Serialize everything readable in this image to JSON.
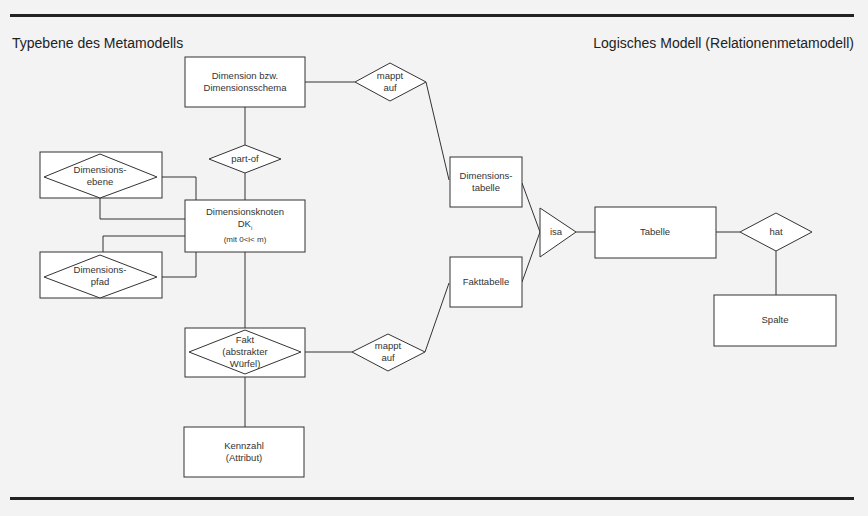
{
  "titles": {
    "left": "Typebene des Metamodells",
    "right": "Logisches Modell (Relationenmetamodell)"
  },
  "entities": {
    "dimension_schema": {
      "line1": "Dimension bzw.",
      "line2": "Dimensionsschema"
    },
    "dimensionsknoten": {
      "line1": "Dimensionsknoten",
      "line2": "DK",
      "sub": "i",
      "line3": "(mit 0<i< m)"
    },
    "dimensionsebene": {
      "line1": "Dimensions-",
      "line2": "ebene"
    },
    "dimensionspfad": {
      "line1": "Dimensions-",
      "line2": "pfad"
    },
    "fakt": {
      "line1": "Fakt",
      "line2": "(abstrakter",
      "line3": "Würfel)"
    },
    "kennzahl": {
      "line1": "Kennzahl",
      "line2": "(Attribut)"
    },
    "dimensionstabelle": {
      "line1": "Dimensions-",
      "line2": "tabelle"
    },
    "fakttabelle": {
      "line1": "Fakttabelle"
    },
    "tabelle": {
      "line1": "Tabelle"
    },
    "spalte": {
      "line1": "Spalte"
    }
  },
  "relationships": {
    "mappt_auf_top": {
      "line1": "mappt",
      "line2": "auf"
    },
    "part_of": {
      "line1": "part-of"
    },
    "mappt_auf_bottom": {
      "line1": "mappt",
      "line2": "auf"
    },
    "isa": {
      "line1": "isa"
    },
    "hat": {
      "line1": "hat"
    }
  },
  "colors": {
    "background": "#f3f3f3",
    "line": "#333333",
    "box_fill": "#ffffff"
  }
}
